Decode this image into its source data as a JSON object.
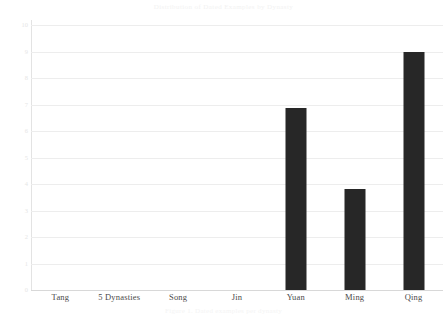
{
  "chart_data": {
    "type": "bar",
    "title": "Distribution of Dated Examples by Dynasty",
    "caption": "Figure 1. Dated examples per dynasty",
    "xlabel": "",
    "ylabel": "",
    "categories": [
      "Tang",
      "5 Dynasties",
      "Song",
      "Jin",
      "Yuan",
      "Ming",
      "Qing"
    ],
    "values": [
      0,
      0,
      0,
      0,
      6.85,
      3.8,
      9
    ],
    "ylim": [
      0,
      10
    ],
    "ytick_labels": [
      "10",
      "9",
      "8",
      "7",
      "6",
      "5",
      "4",
      "3",
      "2",
      "1",
      "0"
    ],
    "ytick_values": [
      10,
      9,
      8,
      7,
      6,
      5,
      4,
      3,
      2,
      1,
      0
    ],
    "grid": true,
    "legend": null,
    "legend_position": "none",
    "bar_color": "#272727",
    "gridline_color": "#ededed",
    "axis_color": "#d8d8d8",
    "background_color": "#ffffff"
  }
}
